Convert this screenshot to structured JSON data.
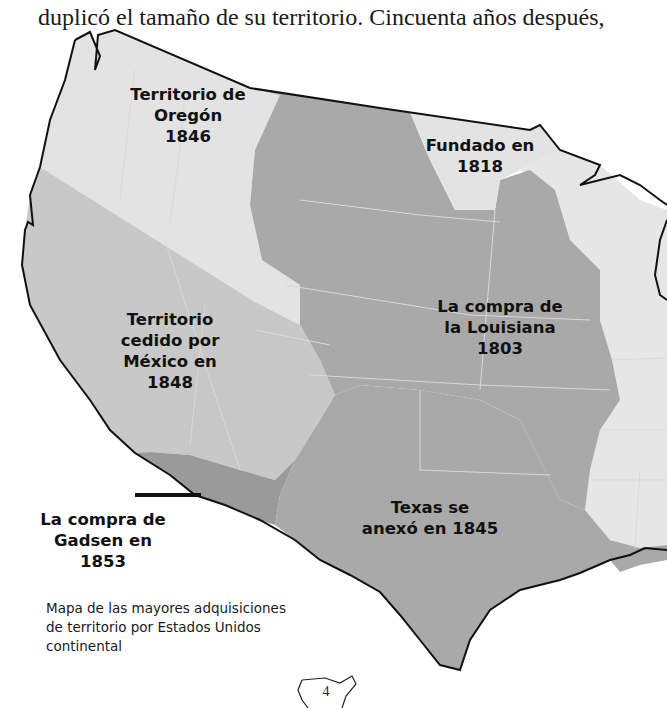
{
  "body_text": "duplicó el tamaño de su territorio. Cincuenta años después,",
  "map": {
    "colors": {
      "original_states": "#e6e6e6",
      "oregon": "#e3e3e3",
      "mexican_cession": "#c8c8c8",
      "louisiana": "#a9a9a9",
      "texas": "#a9a9a9",
      "gadsden": "#9a9a9a",
      "founded_1818": "#e3e3e3",
      "coastline": "#111111",
      "state_lines": "#d9d9d9"
    },
    "regions": [
      {
        "id": "oregon",
        "lines": [
          "Territorio de",
          "Oregón",
          "1846"
        ]
      },
      {
        "id": "founded_1818",
        "lines": [
          "Fundado en",
          "1818"
        ]
      },
      {
        "id": "mexican_cession",
        "lines": [
          "Territorio",
          "cedido por",
          "México en",
          "1848"
        ]
      },
      {
        "id": "louisiana",
        "lines": [
          "La compra de",
          "la Louisiana",
          "1803"
        ]
      },
      {
        "id": "texas",
        "lines": [
          "Texas se",
          "anexó en 1845"
        ]
      },
      {
        "id": "gadsden",
        "lines": [
          "La compra de",
          "Gadsen en",
          "1853"
        ]
      }
    ],
    "caption_lines": [
      "Mapa de las mayores adquisiciones",
      "de territorio por Estados Unidos",
      "continental"
    ]
  },
  "page_number": "4"
}
